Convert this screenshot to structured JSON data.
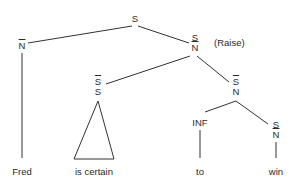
{
  "tree": {
    "root": {
      "label": "S"
    },
    "left_np": {
      "label": "N",
      "bar": true
    },
    "raise_node": {
      "top": "S",
      "bottom": "N",
      "bottom_bar": true
    },
    "raise_note": "(Raise)",
    "vp_node": {
      "top": "S",
      "bottom": "S",
      "top_bar": true
    },
    "sbar_node": {
      "top": "S",
      "bottom": "N",
      "top_bar": true
    },
    "inf_node": {
      "label": "INF"
    },
    "right_node": {
      "top": "S",
      "bottom": "N",
      "bottom_bar": true
    },
    "words": [
      "Fred",
      "is certain",
      "to",
      "win"
    ]
  }
}
